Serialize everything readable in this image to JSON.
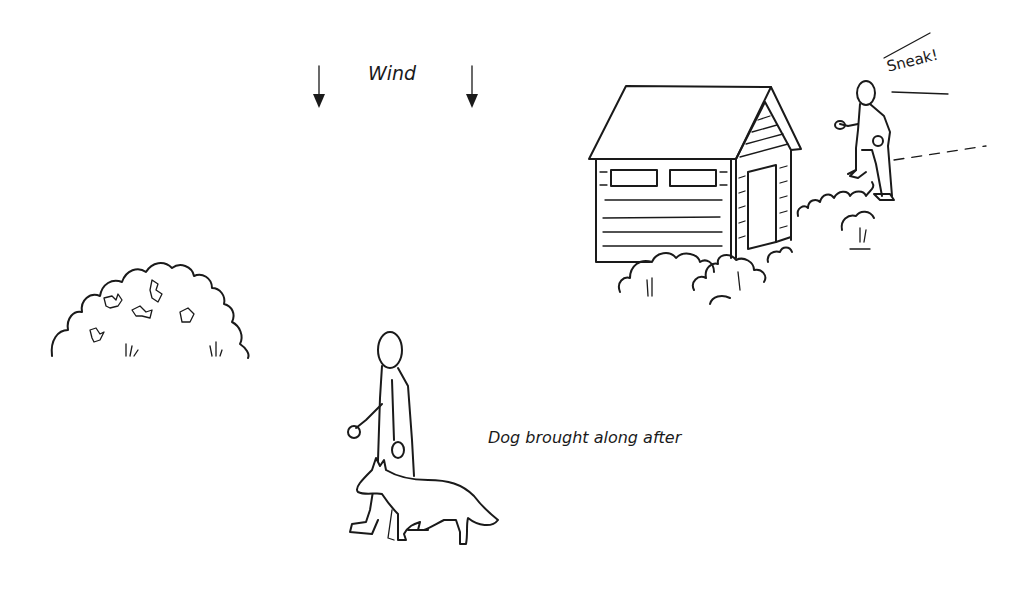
{
  "labels": {
    "wind": "Wind",
    "sneak": "Sneak!",
    "dog_caption": "Dog brought along after"
  },
  "scene": {
    "elements": [
      {
        "name": "wind-arrow-left",
        "description": "downward arrow"
      },
      {
        "name": "wind-arrow-right",
        "description": "downward arrow"
      },
      {
        "name": "shed",
        "description": "wooden shed with two windows and side door"
      },
      {
        "name": "sneaking-person",
        "description": "person creeping up behind shed"
      },
      {
        "name": "bush-left",
        "description": "large round bush with leaves"
      },
      {
        "name": "walking-person",
        "description": "person walking"
      },
      {
        "name": "dog",
        "description": "dog walking beside person"
      }
    ]
  },
  "colors": {
    "ink": "#1a1a1a",
    "background": "#ffffff"
  }
}
